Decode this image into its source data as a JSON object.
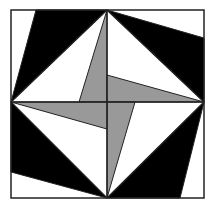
{
  "figure": {
    "title": "",
    "colors": {
      "background": "#ffffff",
      "black": "#000000",
      "white": "#ffffff",
      "gray": "#999999",
      "stroke": "#222222"
    },
    "square": {
      "x1": 11,
      "y1": 10,
      "x2": 204,
      "y2": 198
    },
    "center": {
      "x": 107,
      "y": 102
    },
    "shapes": [
      {
        "name": "black-triangle-top-left",
        "fill": "black",
        "points": "36,10 107,10 11,102"
      },
      {
        "name": "black-triangle-top-right",
        "fill": "black",
        "points": "107,10 204,38 204,102"
      },
      {
        "name": "black-triangle-bottom-right",
        "fill": "black",
        "points": "204,102 180,198 107,198"
      },
      {
        "name": "black-triangle-bottom-left",
        "fill": "black",
        "points": "107,198 11,172 11,102"
      },
      {
        "name": "gray-blade-top",
        "fill": "gray",
        "points": "107,10 107,102 79,102"
      },
      {
        "name": "gray-blade-right",
        "fill": "gray",
        "points": "204,102 107,102 107,75"
      },
      {
        "name": "gray-blade-bottom",
        "fill": "gray",
        "points": "107,198 107,102 135,102"
      },
      {
        "name": "gray-blade-left",
        "fill": "gray",
        "points": "11,102 107,102 107,129"
      }
    ],
    "lines": [
      {
        "name": "diamond-edge-top-left",
        "x1": 11,
        "y1": 102,
        "x2": 107,
        "y2": 10
      },
      {
        "name": "diamond-edge-top-right",
        "x1": 107,
        "y1": 10,
        "x2": 204,
        "y2": 102
      },
      {
        "name": "diamond-edge-bottom-right",
        "x1": 204,
        "y1": 102,
        "x2": 107,
        "y2": 198
      },
      {
        "name": "diamond-edge-bottom-left",
        "x1": 107,
        "y1": 198,
        "x2": 11,
        "y2": 102
      },
      {
        "name": "center-vertical",
        "x1": 107,
        "y1": 10,
        "x2": 107,
        "y2": 198
      },
      {
        "name": "center-horizontal",
        "x1": 11,
        "y1": 102,
        "x2": 204,
        "y2": 102
      }
    ]
  }
}
